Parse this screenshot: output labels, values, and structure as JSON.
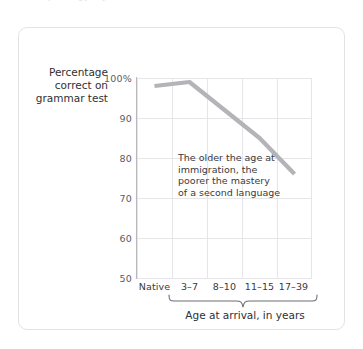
{
  "top_clipped_text": "ceived pr  in     ogy it    y . . . . .",
  "figure": {
    "y_axis_title": "Percentage correct on grammar test",
    "x_axis_title": "Age at arrival, in years",
    "annotation": "The older the age at immigration, the poorer the mastery of a second language",
    "line_color": "#b4b4b8",
    "grid_color": "#e6e6e8",
    "axis_color": "#b9b9bd",
    "card_border_color": "#e3e3e5"
  },
  "chart_data": {
    "type": "line",
    "title": "",
    "xlabel": "Age at arrival, in years",
    "ylabel": "Percentage correct on grammar test",
    "categories": [
      "Native",
      "3–7",
      "8–10",
      "11–15",
      "17–39"
    ],
    "values": [
      98,
      99,
      92,
      85,
      76
    ],
    "ytick_labels": [
      "100%",
      "90",
      "80",
      "70",
      "60",
      "50"
    ],
    "ytick_values": [
      100,
      90,
      80,
      70,
      60,
      50
    ],
    "ylim": [
      50,
      100
    ],
    "grid": true,
    "legend": "none",
    "annotations": [
      {
        "text": "The older the age at immigration, the poorer the mastery of a second language",
        "x_category": "8–10",
        "y_value": 82
      }
    ],
    "brace": {
      "covers": [
        "3–7",
        "8–10",
        "11–15",
        "17–39"
      ],
      "label": "Age at arrival, in years"
    }
  }
}
